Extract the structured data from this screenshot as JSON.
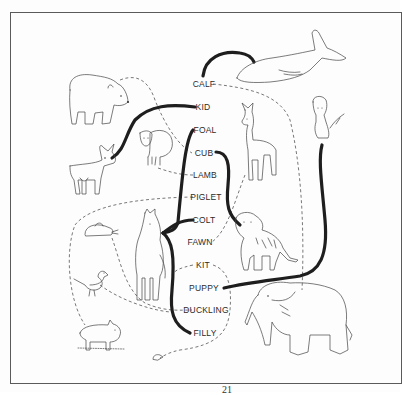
{
  "worksheet": {
    "title": "Match baby animals to their parents",
    "page_number": "21",
    "labels": [
      {
        "id": "calf",
        "text": "CALF",
        "x": 204,
        "y": 84
      },
      {
        "id": "kid",
        "text": "KID",
        "x": 202,
        "y": 107
      },
      {
        "id": "foal",
        "text": "FOAL",
        "x": 205,
        "y": 130
      },
      {
        "id": "cub",
        "text": "CUB",
        "x": 203,
        "y": 153
      },
      {
        "id": "lamb",
        "text": "LAMB",
        "x": 205,
        "y": 175
      },
      {
        "id": "piglet",
        "text": "PIGLET",
        "x": 206,
        "y": 197
      },
      {
        "id": "colt",
        "text": "COLT",
        "x": 204,
        "y": 220
      },
      {
        "id": "fawn",
        "text": "FAWN",
        "x": 200,
        "y": 242
      },
      {
        "id": "kit",
        "text": "KIT",
        "x": 203,
        "y": 265
      },
      {
        "id": "puppy",
        "text": "PUPPY",
        "x": 204,
        "y": 288
      },
      {
        "id": "duckling",
        "text": "DUCKLING",
        "x": 206,
        "y": 310
      },
      {
        "id": "filly",
        "text": "FILLY",
        "x": 205,
        "y": 333
      }
    ],
    "animals": [
      {
        "name": "bear",
        "matches": "cub"
      },
      {
        "name": "goat",
        "matches": "kid"
      },
      {
        "name": "sheep",
        "matches": "lamb"
      },
      {
        "name": "rabbit",
        "matches": "kit"
      },
      {
        "name": "horse",
        "matches": [
          "foal",
          "colt",
          "filly"
        ]
      },
      {
        "name": "duck",
        "matches": "duckling"
      },
      {
        "name": "pig",
        "matches": "piglet"
      },
      {
        "name": "mouse",
        "matches": ""
      },
      {
        "name": "whale",
        "matches": "calf"
      },
      {
        "name": "deer",
        "matches": "fawn"
      },
      {
        "name": "dog",
        "matches": "puppy"
      },
      {
        "name": "tiger",
        "matches": "cub"
      },
      {
        "name": "elephant",
        "matches": "calf"
      }
    ]
  }
}
